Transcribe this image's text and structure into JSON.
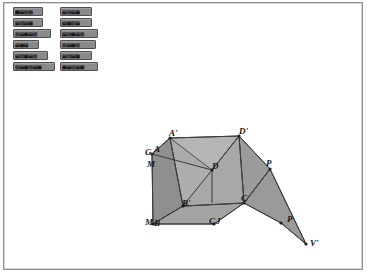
{
  "window": {
    "title": "Geometry Figure",
    "background_color": "#ffffff",
    "border_color": "#8d8d8d"
  },
  "toolbar": {
    "button_fill": "#8a8a8a",
    "button_border": "#4e4e4e",
    "columns": [
      {
        "name": "left-column",
        "buttons": [
          {
            "label": "■▤▥▨",
            "width": 30
          },
          {
            "label": "▤▥▤▦",
            "width": 30
          },
          {
            "label": "▥▤▦▤▥",
            "width": 38
          },
          {
            "label": "▤▦▤",
            "width": 26
          },
          {
            "label": "▤▥▦▤▥",
            "width": 35
          },
          {
            "label": "▥▤▦▥▤▦",
            "width": 42
          }
        ]
      },
      {
        "name": "right-column",
        "buttons": [
          {
            "label": "▤▥▤▦",
            "width": 32
          },
          {
            "label": "▤▦▥▤",
            "width": 32
          },
          {
            "label": "▤▥▦▤▥",
            "width": 38
          },
          {
            "label": "▥▤▦▥",
            "width": 36
          },
          {
            "label": "▤▥▤▦",
            "width": 32
          },
          {
            "label": "▦▤▥▤▦",
            "width": 38
          }
        ]
      }
    ]
  },
  "figure": {
    "name": "3d-prism-with-flap",
    "colors": {
      "top_face": "#b5b5b5",
      "left_face": "#8f8f8f",
      "front_face": "#a3a3a3",
      "right_face": "#9b9b9b",
      "flap_face": "#9a9a9a",
      "edge": "#3c3c3c",
      "vertex": "#1e1e1e"
    },
    "vertices": [
      {
        "id": "A-prime",
        "label": "A'",
        "x": 165,
        "y": 133
      },
      {
        "id": "D-prime",
        "label": "D'",
        "x": 235,
        "y": 131
      },
      {
        "id": "G",
        "label": "G",
        "x": 141,
        "y": 152
      },
      {
        "id": "A",
        "label": "A",
        "x": 150,
        "y": 149
      },
      {
        "id": "M",
        "label": "M",
        "x": 143,
        "y": 164
      },
      {
        "id": "D",
        "label": "D",
        "x": 208,
        "y": 166
      },
      {
        "id": "B-prime",
        "label": "B'",
        "x": 178,
        "y": 203
      },
      {
        "id": "C",
        "label": "C",
        "x": 237,
        "y": 198
      },
      {
        "id": "M2",
        "label": "M",
        "x": 141,
        "y": 222
      },
      {
        "id": "B",
        "label": "B",
        "x": 150,
        "y": 223
      },
      {
        "id": "C2",
        "label": "C",
        "x": 205,
        "y": 221
      },
      {
        "id": "J",
        "label": "J",
        "x": 212,
        "y": 221
      },
      {
        "id": "P-top",
        "label": "P",
        "x": 262,
        "y": 163
      },
      {
        "id": "P-bottom",
        "label": "P",
        "x": 283,
        "y": 219
      },
      {
        "id": "V-prime",
        "label": "V'",
        "x": 306,
        "y": 243
      }
    ]
  }
}
